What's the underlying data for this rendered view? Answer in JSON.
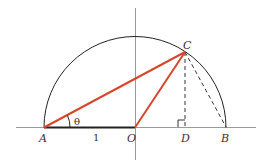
{
  "diagram": {
    "type": "geometry",
    "colors": {
      "axis": "#999999",
      "circle": "#222222",
      "highlight": "#d9452b",
      "dashed": "#333333"
    },
    "points": {
      "A": {
        "label": "A"
      },
      "O": {
        "label": "O"
      },
      "D": {
        "label": "D"
      },
      "B": {
        "label": "B"
      },
      "C": {
        "label": "C"
      }
    },
    "angle_label": "θ",
    "segment_label": "1",
    "right_angle_marker_at": "D",
    "segments": [
      {
        "from": "A",
        "to": "C",
        "style": "solid",
        "color": "highlight"
      },
      {
        "from": "O",
        "to": "C",
        "style": "solid",
        "color": "highlight"
      },
      {
        "from": "A",
        "to": "O",
        "style": "solid-bold",
        "color": "dark"
      },
      {
        "from": "C",
        "to": "D",
        "style": "dashed"
      },
      {
        "from": "C",
        "to": "B",
        "style": "dashed"
      }
    ]
  }
}
